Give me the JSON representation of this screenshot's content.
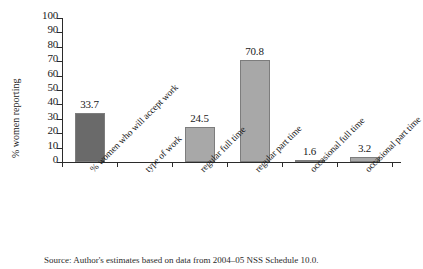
{
  "chart_data": {
    "type": "bar",
    "title": "",
    "xlabel": "",
    "ylabel": "% women reporting",
    "ylim": [
      0,
      100
    ],
    "ytick_step": 10,
    "yticks": [
      "100",
      "90",
      "80",
      "70",
      "60",
      "50",
      "40",
      "30",
      "20",
      "10",
      "0"
    ],
    "grid": false,
    "legend": "none",
    "categories": [
      "% women who will accept work",
      "type of work",
      "regular full time",
      "regular part time",
      "occasional full time",
      "occasional part time"
    ],
    "values": [
      33.7,
      null,
      24.5,
      70.8,
      1.6,
      3.2
    ],
    "value_labels": [
      "33.7",
      "",
      "24.5",
      "70.8",
      "1.6",
      "3.2"
    ],
    "bar_colors": [
      "#6a6a6a",
      "",
      "#a8a8a8",
      "#a8a8a8",
      "#a8a8a8",
      "#a8a8a8"
    ]
  },
  "axis": {
    "y_title": "% women reporting"
  },
  "caption": {
    "text": "Source: Author's estimates based on data from 2004–05 NSS Schedule 10.0."
  },
  "colors": {
    "bar_dark": "#6a6a6a",
    "bar_light": "#a8a8a8",
    "axis": "#2b2b2b",
    "text": "#1a1a1a",
    "background": "#ffffff"
  }
}
